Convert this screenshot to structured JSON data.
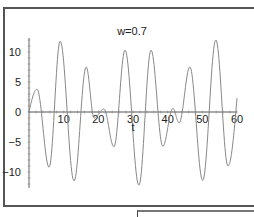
{
  "chart_data": {
    "type": "line",
    "title": "w=0.7",
    "xlabel": "t",
    "ylabel": "",
    "xlim": [
      0,
      60
    ],
    "ylim": [
      -12.5,
      12.5
    ],
    "grid": false,
    "legend": null,
    "x_ticks": [
      10,
      20,
      30,
      40,
      50,
      60
    ],
    "y_ticks": [
      -10,
      -5,
      0,
      5,
      10
    ],
    "series": [
      {
        "name": "x(t)",
        "color": "#888888",
        "points": [
          [
            0,
            0
          ],
          [
            2.3,
            3.8
          ],
          [
            5.8,
            -9.2
          ],
          [
            9.0,
            11.8
          ],
          [
            13.0,
            -11.5
          ],
          [
            16.5,
            7.5
          ],
          [
            18.8,
            -1.0
          ],
          [
            21.6,
            0.5
          ],
          [
            24.5,
            -5.8
          ],
          [
            27.7,
            10.3
          ],
          [
            31.7,
            -12.2
          ],
          [
            35.2,
            10.3
          ],
          [
            38.6,
            -5.7
          ],
          [
            41.5,
            0.6
          ],
          [
            43.3,
            -1.8
          ],
          [
            46.4,
            7.5
          ],
          [
            50.1,
            -11.4
          ],
          [
            53.9,
            12.0
          ],
          [
            57.4,
            -9.0
          ],
          [
            60,
            2.3
          ]
        ]
      }
    ]
  },
  "labels": {
    "title": "w=0.7",
    "xlabel": "t"
  }
}
